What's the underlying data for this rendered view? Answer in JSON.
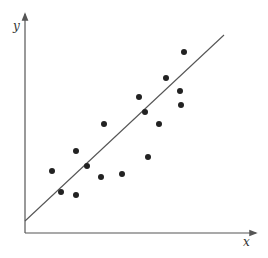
{
  "chart_data": {
    "type": "scatter",
    "title": "",
    "xlabel": "x",
    "ylabel": "y",
    "grid": false,
    "legend": null,
    "xlim": [
      0,
      230
    ],
    "ylim": [
      0,
      218
    ],
    "points": [
      {
        "x": 27,
        "y": 62
      },
      {
        "x": 36,
        "y": 41
      },
      {
        "x": 51,
        "y": 82
      },
      {
        "x": 51,
        "y": 38
      },
      {
        "x": 62,
        "y": 67
      },
      {
        "x": 76,
        "y": 56
      },
      {
        "x": 79,
        "y": 109
      },
      {
        "x": 97,
        "y": 59
      },
      {
        "x": 114,
        "y": 136
      },
      {
        "x": 120,
        "y": 121
      },
      {
        "x": 123,
        "y": 76
      },
      {
        "x": 134,
        "y": 109
      },
      {
        "x": 141,
        "y": 155
      },
      {
        "x": 155,
        "y": 142
      },
      {
        "x": 156,
        "y": 128
      },
      {
        "x": 159,
        "y": 181
      }
    ],
    "regression_line": {
      "x1": 0,
      "y1": 12,
      "x2": 199,
      "y2": 198
    },
    "colors": {
      "axis": "#555555",
      "points": "#222222",
      "line": "#555555"
    }
  },
  "labels": {
    "x_axis": "x",
    "y_axis": "y"
  }
}
